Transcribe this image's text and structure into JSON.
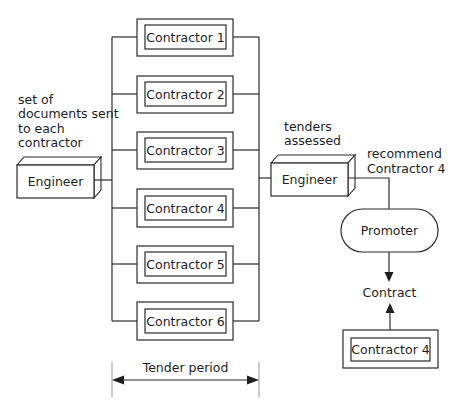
{
  "diagram": {
    "annotations": {
      "documents_sent": [
        "set of",
        "documents sent",
        "to each",
        "contractor"
      ],
      "tenders_assessed": [
        "tenders",
        "assessed"
      ],
      "recommend": [
        "recommend",
        "Contractor 4"
      ]
    },
    "engineer_left": {
      "label": "Engineer"
    },
    "engineer_right": {
      "label": "Engineer"
    },
    "contractors": [
      {
        "label": "Contractor 1"
      },
      {
        "label": "Contractor 2"
      },
      {
        "label": "Contractor 3"
      },
      {
        "label": "Contractor 4"
      },
      {
        "label": "Contractor 5"
      },
      {
        "label": "Contractor 6"
      }
    ],
    "promoter": {
      "label": "Promoter"
    },
    "contract": {
      "label": "Contract"
    },
    "awarded_contractor": {
      "label": "Contractor 4"
    },
    "tender_period": {
      "label": "Tender period"
    }
  }
}
